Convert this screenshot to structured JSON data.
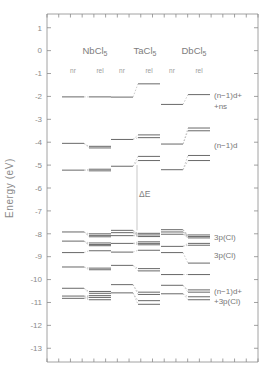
{
  "chart_data": {
    "type": "line",
    "title": "",
    "xlabel": "",
    "ylabel": "Energy  (eV)",
    "ylim": [
      -13.6,
      1.6
    ],
    "yticks": [
      1,
      0,
      -1,
      -2,
      -3,
      -4,
      -5,
      -6,
      -7,
      -8,
      -9,
      -10,
      -11,
      -12,
      -13
    ],
    "ytick_labels": [
      "1",
      "0",
      "-1",
      "-2",
      "-3",
      "-4",
      "-5",
      "-6",
      "-7",
      "-8",
      "-9",
      "-10",
      "-11",
      "-12",
      "-13"
    ],
    "grid": false,
    "legend": "none",
    "annotations": [
      {
        "name": "delta-e",
        "text": "ΔE",
        "x_frac": 0.455,
        "y_value": -6.4
      },
      {
        "name": "delta-e-bar-top",
        "y_value": -5.0
      },
      {
        "name": "delta-e-bar-bottom",
        "y_value": -7.85
      }
    ],
    "columns": [
      {
        "molecule": "NbCl",
        "molecule_sub": "5",
        "head_x": 95,
        "sub_columns": [
          {
            "label": "nr",
            "center_x": 73
          },
          {
            "label": "rel",
            "center_x": 100
          }
        ],
        "pairs": [
          {
            "group": "(n-1)d+ns",
            "nr": [
              -2.02
            ],
            "rel": [
              -2.02
            ]
          },
          {
            "group": "(n-1)d",
            "nr": [
              -4.05
            ],
            "rel": [
              -4.18,
              -4.25
            ]
          },
          {
            "group": "(n-1)d-lower",
            "nr": [
              -5.22
            ],
            "rel": [
              -5.18,
              -5.25
            ]
          },
          {
            "group": "3p(Cl)-a",
            "nr": [
              -7.92
            ],
            "rel": [
              -8.0,
              -8.07,
              -8.13
            ]
          },
          {
            "group": "3p(Cl)-b",
            "nr": [
              -8.32
            ],
            "rel": [
              -8.4,
              -8.47,
              -8.52
            ]
          },
          {
            "group": "3p(Cl)-c",
            "nr": [
              -8.82
            ],
            "rel": [
              -8.74
            ]
          },
          {
            "group": "3p(Cl)-d",
            "nr": [
              -9.45
            ],
            "rel": [
              -9.5,
              -9.57
            ]
          },
          {
            "group": "(n-1)d+3p(Cl)-a",
            "nr": [
              -10.38
            ],
            "rel": [
              -10.52,
              -10.6
            ]
          },
          {
            "group": "(n-1)d+3p(Cl)-b",
            "nr": [
              -10.72,
              -10.82
            ],
            "rel": [
              -10.7,
              -10.78,
              -10.88
            ]
          }
        ]
      },
      {
        "molecule": "TaCl",
        "molecule_sub": "5",
        "head_x": 145,
        "sub_columns": [
          {
            "label": "nr",
            "center_x": 122
          },
          {
            "label": "rel",
            "center_x": 149
          }
        ],
        "pairs": [
          {
            "group": "(n-1)d+ns",
            "nr": [
              -2.03
            ],
            "rel": [
              -1.45
            ]
          },
          {
            "group": "(n-1)d",
            "nr": [
              -3.88
            ],
            "rel": [
              -3.68,
              -3.8
            ]
          },
          {
            "group": "(n-1)d-lower",
            "nr": [
              -5.05
            ],
            "rel": [
              -4.62,
              -4.8
            ]
          },
          {
            "group": "3p(Cl)-a",
            "nr": [
              -7.85,
              -7.95,
              -8.08
            ],
            "rel": [
              -7.98,
              -8.05,
              -8.12
            ]
          },
          {
            "group": "3p(Cl)-b",
            "nr": [
              -8.42
            ],
            "rel": [
              -8.35,
              -8.42,
              -8.48
            ]
          },
          {
            "group": "3p(Cl)-c",
            "nr": [
              -8.8
            ],
            "rel": [
              -8.72
            ]
          },
          {
            "group": "3p(Cl)-d",
            "nr": [
              -9.38
            ],
            "rel": [
              -9.52,
              -9.62
            ]
          },
          {
            "group": "(n-1)d+3p(Cl)-a",
            "nr": [
              -10.22
            ],
            "rel": [
              -10.55,
              -10.65
            ]
          },
          {
            "group": "(n-1)d+3p(Cl)-b",
            "nr": [
              -10.58
            ],
            "rel": [
              -10.92,
              -11.08
            ]
          }
        ]
      },
      {
        "molecule": "DbCl",
        "molecule_sub": "5",
        "head_x": 194,
        "sub_columns": [
          {
            "label": "nr",
            "center_x": 172
          },
          {
            "label": "rel",
            "center_x": 199
          }
        ],
        "pairs": [
          {
            "group": "(n-1)d+ns",
            "nr": [
              -2.35
            ],
            "rel": [
              -1.92
            ]
          },
          {
            "group": "(n-1)d",
            "nr": [
              -4.08
            ],
            "rel": [
              -3.38,
              -3.5
            ]
          },
          {
            "group": "(n-1)d-lower",
            "nr": [
              -5.2
            ],
            "rel": [
              -4.58,
              -4.8
            ]
          },
          {
            "group": "3p(Cl)-a",
            "nr": [
              -7.82,
              -7.92,
              -8.02
            ],
            "rel": [
              -8.05,
              -8.12,
              -8.18
            ]
          },
          {
            "group": "3p(Cl)-b",
            "nr": [
              -8.55
            ],
            "rel": [
              -8.42,
              -8.5
            ]
          },
          {
            "group": "3p(Cl)-c",
            "nr": [
              -8.82
            ],
            "rel": [
              -9.28
            ]
          },
          {
            "group": "3p(Cl)-d",
            "nr": [
              -9.78
            ],
            "rel": [
              -9.78
            ]
          },
          {
            "group": "(n-1)d+3p(Cl)-a",
            "nr": [
              -10.25
            ],
            "rel": [
              -10.45,
              -10.55
            ]
          },
          {
            "group": "(n-1)d+3p(Cl)-b",
            "nr": [
              -10.62
            ],
            "rel": [
              -10.75,
              -10.88
            ]
          }
        ]
      }
    ],
    "right_labels": [
      {
        "name": "label-nd-ns-line1",
        "text": "(n−1)d+",
        "y_value": -1.95
      },
      {
        "name": "label-nd-ns-line2",
        "text": "+ns",
        "y_value": -2.42
      },
      {
        "name": "label-nd",
        "text": "(n−1)d",
        "y_value": -4.12
      },
      {
        "name": "label-3p-cl-upper",
        "text": "3p(Cl)",
        "y_value": -8.15
      },
      {
        "name": "label-3p-cl-lower",
        "text": "3p(Cl)",
        "y_value": -8.93
      },
      {
        "name": "label-nd-3p-line1",
        "text": "(n−1)d+",
        "y_value": -10.48
      },
      {
        "name": "label-nd-3p-line2",
        "text": "+3p(Cl)",
        "y_value": -10.95
      }
    ]
  },
  "figure": {
    "y_axis_title": "Energy  (eV)",
    "delta_label": "ΔE",
    "sub_label_nr": "nr",
    "sub_label_rel": "rel",
    "colors": {
      "level": "#6f6f6f",
      "connector": "#b4b4b4",
      "axis": "#8a8a8a",
      "text": "#7d7d7d",
      "background": "#ffffff"
    }
  }
}
